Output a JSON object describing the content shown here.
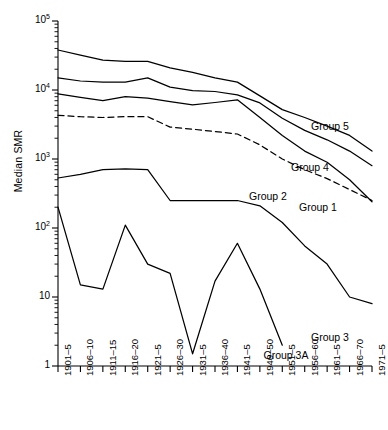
{
  "chart_data": {
    "type": "line",
    "title": "",
    "xlabel": "",
    "ylabel": "Median SMR",
    "yscale": "log",
    "ylim": [
      1,
      100000
    ],
    "ytick_values": [
      1,
      10,
      100,
      1000,
      10000,
      100000
    ],
    "ytick_labels": [
      "1",
      "10",
      "10^2",
      "10^3",
      "10^4",
      "10^5"
    ],
    "grid": false,
    "legend_position": "inline-right-of-line-ends",
    "categories": [
      "1901–5",
      "1906–10",
      "1911–15",
      "1916–20",
      "1921–5",
      "1926–30",
      "1931–5",
      "1936–40",
      "1941–5",
      "1946–50",
      "1951–5",
      "1956–60",
      "1961–5",
      "1966–70",
      "1971–5"
    ],
    "series": [
      {
        "name": "Group 5",
        "label": "Group 5",
        "style": "solid",
        "values": [
          38000,
          32000,
          27000,
          26000,
          26000,
          21000,
          18000,
          15000,
          13000,
          8200,
          5200,
          4000,
          3000,
          2200,
          1300
        ]
      },
      {
        "name": "Group 4",
        "label": "Group 4",
        "style": "solid",
        "values": [
          15000,
          13500,
          13000,
          13000,
          15000,
          11000,
          9800,
          9500,
          8500,
          6500,
          3900,
          2600,
          1900,
          1300,
          800
        ]
      },
      {
        "name": "Group 1",
        "label": "Group 1",
        "style": "solid",
        "values": [
          8800,
          7800,
          7000,
          8000,
          7600,
          6800,
          6100,
          6600,
          7200,
          4000,
          2200,
          1300,
          900,
          500,
          240
        ]
      },
      {
        "name": "Group 2",
        "label": "Group 2",
        "style": "dashed",
        "values": [
          4300,
          4100,
          4000,
          4100,
          4100,
          2900,
          2700,
          2500,
          2300,
          1600,
          1000,
          700,
          520,
          360,
          250
        ]
      },
      {
        "name": "Group 3",
        "label": "Group 3",
        "style": "solid",
        "values": [
          530,
          600,
          700,
          720,
          700,
          250,
          250,
          250,
          250,
          210,
          120,
          55,
          30,
          10,
          8
        ]
      },
      {
        "name": "Group 3A",
        "label": "Group 3A",
        "style": "solid",
        "values": [
          200,
          15,
          13,
          110,
          30,
          22,
          1.5,
          17,
          60,
          13,
          2,
          null,
          null,
          null,
          null
        ]
      }
    ],
    "series_labels": [
      {
        "text": "Group 5",
        "anchor_category": "1961–5"
      },
      {
        "text": "Group 4",
        "anchor_category": "1961–5"
      },
      {
        "text": "Group 2",
        "anchor_category": "1951–5"
      },
      {
        "text": "Group 1",
        "anchor_category": "1966–70"
      },
      {
        "text": "Group 3",
        "anchor_category": "1966–70"
      },
      {
        "text": "Group 3A",
        "anchor_category": "1956–60"
      }
    ]
  }
}
